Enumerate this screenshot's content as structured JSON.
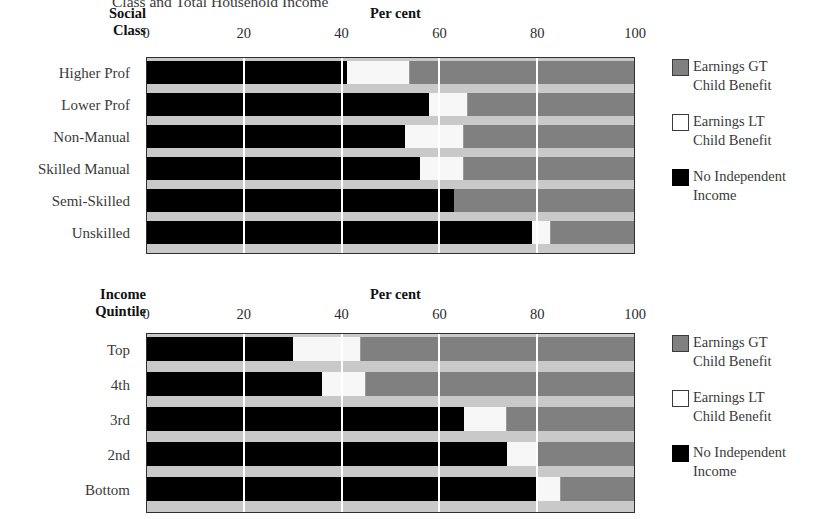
{
  "figure": {
    "title": "Class and Total Household Income",
    "axis_title": "Per cent",
    "tick_labels": [
      "0",
      "20",
      "40",
      "60",
      "80",
      "100"
    ],
    "tick_values": [
      0,
      20,
      40,
      60,
      80,
      100
    ]
  },
  "legend": {
    "items": [
      {
        "name": "earnings-gt",
        "line1": "Earnings GT",
        "line2": "Child Benefit",
        "color": "#808080"
      },
      {
        "name": "earnings-lt",
        "line1": "Earnings LT",
        "line2": "Child Benefit",
        "color": "#ffffff"
      },
      {
        "name": "no-income",
        "line1": "No Independent",
        "line2": "Income",
        "color": "#000000"
      }
    ]
  },
  "panels": [
    {
      "id": "social",
      "header_line1": "Social",
      "header_line2": "Class"
    },
    {
      "id": "income",
      "header_line1": "Income",
      "header_line2": "Quintile"
    }
  ],
  "chart_data": [
    {
      "type": "bar",
      "orientation": "horizontal",
      "stacked": true,
      "title": "Class and Total Household Income",
      "xlabel": "Per cent",
      "ylabel": "Social Class",
      "xlim": [
        0,
        100
      ],
      "grid": true,
      "legend_position": "right",
      "categories": [
        "Higher Prof",
        "Lower Prof",
        "Non-Manual",
        "Skilled Manual",
        "Semi-Skilled",
        "Unskilled"
      ],
      "series": [
        {
          "name": "No Independent Income",
          "color": "#000000",
          "values": [
            41,
            58,
            53,
            56,
            63,
            79
          ]
        },
        {
          "name": "Earnings LT Child Benefit",
          "color": "#ffffff",
          "values": [
            13,
            8,
            12,
            9,
            0,
            4
          ]
        },
        {
          "name": "Earnings GT Child Benefit",
          "color": "#808080",
          "values": [
            46,
            34,
            35,
            35,
            37,
            17
          ]
        }
      ]
    },
    {
      "type": "bar",
      "orientation": "horizontal",
      "stacked": true,
      "title": "Class and Total Household Income",
      "xlabel": "Per cent",
      "ylabel": "Income Quintile",
      "xlim": [
        0,
        100
      ],
      "grid": true,
      "legend_position": "right",
      "categories": [
        "Top",
        "4th",
        "3rd",
        "2nd",
        "Bottom"
      ],
      "series": [
        {
          "name": "No Independent Income",
          "color": "#000000",
          "values": [
            30,
            36,
            65,
            74,
            80
          ]
        },
        {
          "name": "Earnings LT Child Benefit",
          "color": "#ffffff",
          "values": [
            14,
            9,
            9,
            6,
            5
          ]
        },
        {
          "name": "Earnings GT Child Benefit",
          "color": "#808080",
          "values": [
            56,
            55,
            26,
            20,
            15
          ]
        }
      ]
    }
  ]
}
